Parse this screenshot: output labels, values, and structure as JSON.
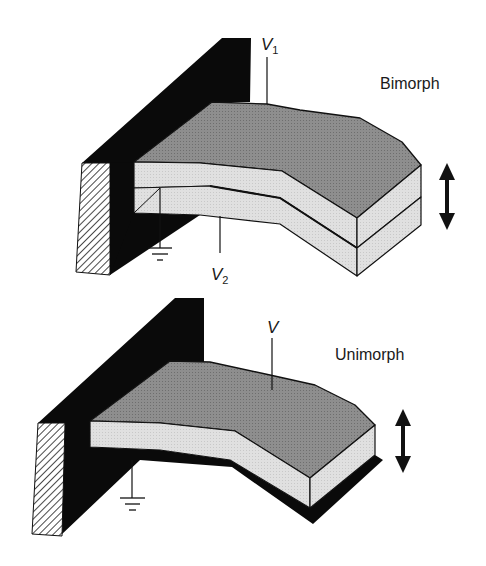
{
  "colors": {
    "background": "#ffffff",
    "wall": "#0a0a0a",
    "hatch_bg": "#ffffff",
    "hatch_line": "#1a1a1a",
    "top_face": "#8c8c8c",
    "side_face": "#dedede",
    "outline": "#111111",
    "substrate": "#0a0a0a"
  },
  "bimorph": {
    "title": "Bimorph",
    "electrode_top": {
      "symbol": "V",
      "subscript": "1"
    },
    "electrode_bottom": {
      "symbol": "V",
      "subscript": "2"
    },
    "ground_icon": "ground-symbol",
    "motion_icon": "double-arrow-vertical"
  },
  "unimorph": {
    "title": "Unimorph",
    "electrode": {
      "symbol": "V"
    },
    "ground_icon": "ground-symbol",
    "motion_icon": "double-arrow-vertical"
  }
}
